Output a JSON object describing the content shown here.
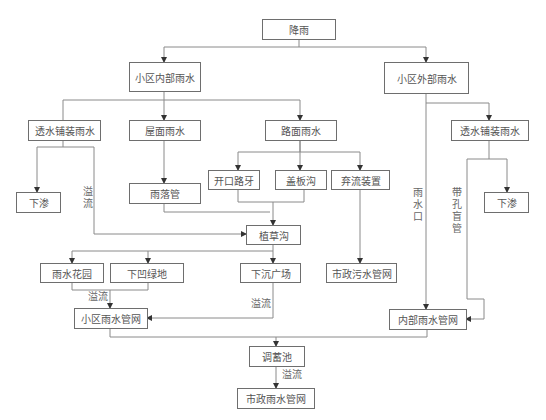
{
  "diagram": {
    "type": "flowchart",
    "title": "",
    "nodes": {
      "rain": "降雨",
      "inner_rain": "小区内部雨水",
      "outer_rain": "小区外部雨水",
      "permeable_left": "透水铺装雨水",
      "roof_rain": "屋面雨水",
      "road_rain": "路面雨水",
      "permeable_right": "透水铺装雨水",
      "infiltrate_left": "下渗",
      "open_curb": "开口路牙",
      "cover_ditch": "盖板沟",
      "diversion_device": "弃流装置",
      "downpipe": "雨落管",
      "infiltrate_right": "下渗",
      "grass_swale": "植草沟",
      "rain_garden": "雨水花园",
      "sunken_green": "下凹绿地",
      "sunken_plaza": "下沉广场",
      "municipal_sewage": "市政污水管网",
      "community_storm_net": "小区雨水管网",
      "internal_storm_net": "内部雨水管网",
      "storage_pond": "调蓄池",
      "municipal_storm_net": "市政雨水管网"
    },
    "edge_labels": {
      "overflow_left": "溢流",
      "overflow_gardens": "溢流",
      "overflow_plaza": "溢流",
      "overflow_pond": "溢流",
      "rain_inlet": "雨水口",
      "perforated_pipe": "带孔盲管"
    },
    "edges": [
      {
        "from": "降雨",
        "to": "小区内部雨水"
      },
      {
        "from": "降雨",
        "to": "小区外部雨水"
      },
      {
        "from": "小区内部雨水",
        "to": "透水铺装雨水"
      },
      {
        "from": "小区内部雨水",
        "to": "屋面雨水"
      },
      {
        "from": "小区内部雨水",
        "to": "路面雨水"
      },
      {
        "from": "透水铺装雨水",
        "to": "下渗"
      },
      {
        "from": "透水铺装雨水",
        "to": "植草沟",
        "label": "溢流"
      },
      {
        "from": "屋面雨水",
        "to": "雨落管"
      },
      {
        "from": "雨落管",
        "to": "植草沟"
      },
      {
        "from": "路面雨水",
        "to": "开口路牙"
      },
      {
        "from": "路面雨水",
        "to": "盖板沟"
      },
      {
        "from": "路面雨水",
        "to": "弃流装置"
      },
      {
        "from": "开口路牙",
        "to": "植草沟"
      },
      {
        "from": "盖板沟",
        "to": "植草沟"
      },
      {
        "from": "弃流装置",
        "to": "市政污水管网"
      },
      {
        "from": "植草沟",
        "to": "雨水花园"
      },
      {
        "from": "植草沟",
        "to": "下凹绿地"
      },
      {
        "from": "植草沟",
        "to": "下沉广场"
      },
      {
        "from": "雨水花园",
        "to": "小区雨水管网",
        "label": "溢流"
      },
      {
        "from": "下凹绿地",
        "to": "小区雨水管网",
        "label": "溢流"
      },
      {
        "from": "下沉广场",
        "to": "小区雨水管网",
        "label": "溢流"
      },
      {
        "from": "小区外部雨水",
        "to": "内部雨水管网",
        "label": "雨水口"
      },
      {
        "from": "小区外部雨水",
        "to": "透水铺装雨水"
      },
      {
        "from": "透水铺装雨水",
        "to": "下渗"
      },
      {
        "from": "透水铺装雨水",
        "to": "内部雨水管网",
        "label": "带孔盲管"
      },
      {
        "from": "小区雨水管网",
        "to": "调蓄池"
      },
      {
        "from": "内部雨水管网",
        "to": "调蓄池"
      },
      {
        "from": "调蓄池",
        "to": "市政雨水管网",
        "label": "溢流"
      }
    ]
  }
}
